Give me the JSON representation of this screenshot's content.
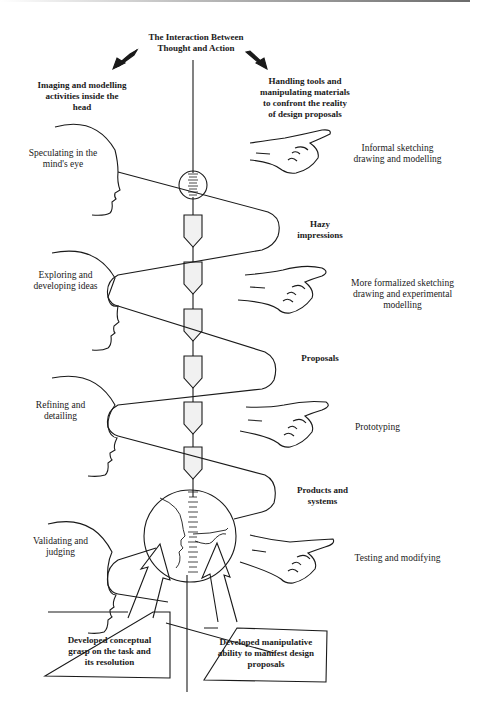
{
  "title": "The Interaction Between\nThought and Action",
  "left_heading": "Imaging and modelling\nactivities inside the\nhead",
  "right_heading": "Handling tools and\nmanipulating materials\nto confront the reality\nof design proposals",
  "head_stages": [
    {
      "label": "Speculating in the\nmind's eye"
    },
    {
      "label": "Exploring and\ndeveloping ideas"
    },
    {
      "label": "Refining and\ndetailing"
    },
    {
      "label": "Validating and\njudging"
    }
  ],
  "hand_stages": [
    {
      "label": "Informal sketching\ndrawing and modelling"
    },
    {
      "label": "More formalized sketching\ndrawing and experimental\nmodelling"
    },
    {
      "label": "Prototyping"
    },
    {
      "label": "Testing and modifying"
    }
  ],
  "outcomes": [
    {
      "label": "Hazy\nimpressions"
    },
    {
      "label": "Proposals"
    },
    {
      "label": "Products and\nsystems"
    }
  ],
  "boxes": {
    "left": "Developed conceptual\ngrasp on the task and\nits resolution",
    "right": "Developed manipulative\nability to manifest design\nproposals"
  },
  "colors": {
    "ink": "#1a1a1a",
    "valve_fill": "#f1f1f1"
  }
}
